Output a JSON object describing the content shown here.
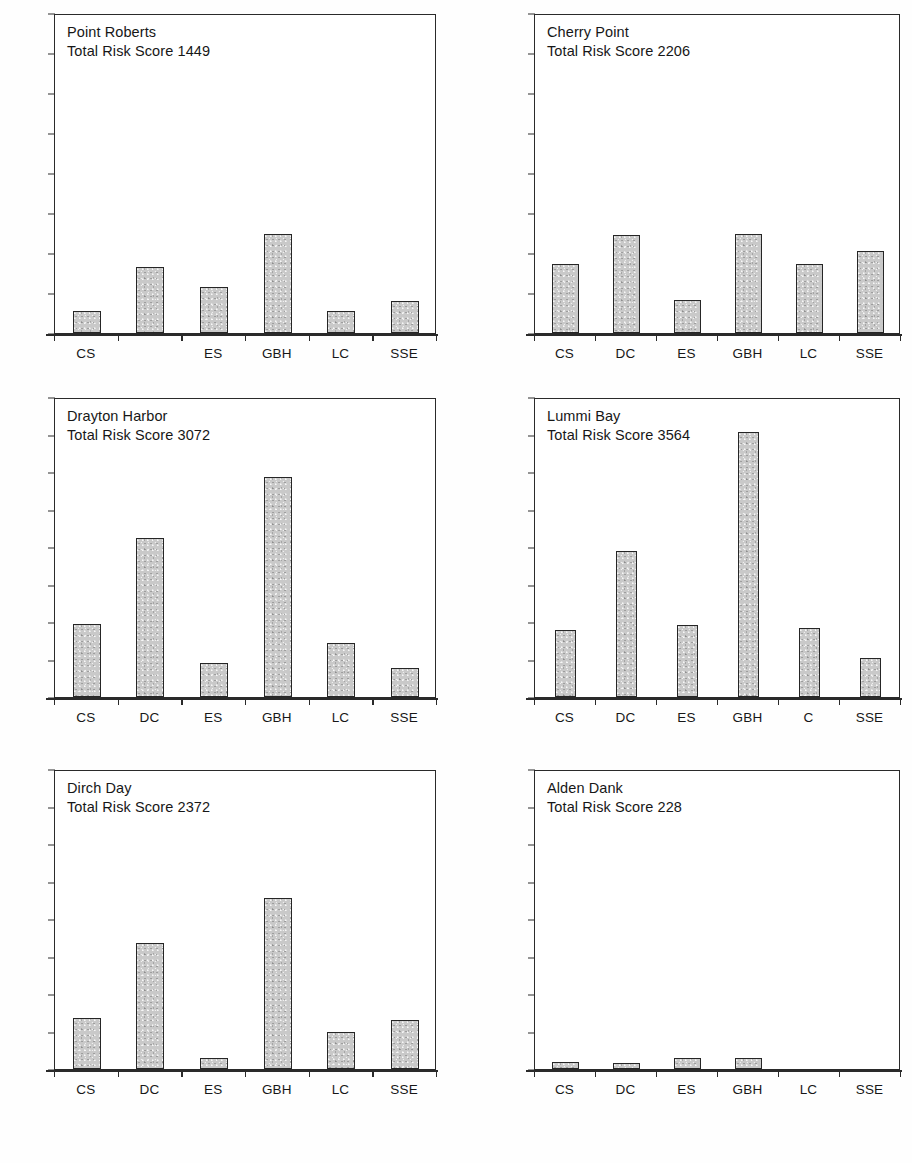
{
  "figure": {
    "axis_max": 1600,
    "axis_min": 0,
    "tick_step": 200,
    "bar_fill_color": "#c9c9c9",
    "bar_border_color": "#262626",
    "frame_color": "#2a2a2a"
  },
  "chart_data": [
    {
      "type": "bar",
      "title": "Point Roberts",
      "subtitle": "Total Risk Score 1449",
      "total_risk_score": 1449,
      "categories": [
        "CS",
        "",
        "ES",
        "GBH",
        "LC",
        "SSE"
      ],
      "values": [
        110,
        330,
        230,
        495,
        110,
        160
      ],
      "xlabel": "",
      "ylabel": "",
      "ylim": [
        0,
        1600
      ],
      "yticks": [
        "0",
        "200",
        "400",
        "600",
        "800",
        "1000",
        "1200",
        "1400",
        "1600"
      ],
      "show_ytick_labels": true,
      "grid": false
    },
    {
      "type": "bar",
      "title": "Cherry Point",
      "subtitle": "Total Risk Score 2206",
      "total_risk_score": 2206,
      "categories": [
        "CS",
        "DC",
        "ES",
        "GBH",
        "LC",
        "SSE"
      ],
      "values": [
        345,
        490,
        165,
        495,
        345,
        410
      ],
      "xlabel": "",
      "ylabel": "",
      "ylim": [
        0,
        1600
      ],
      "yticks": [],
      "show_ytick_labels": false,
      "grid": false
    },
    {
      "type": "bar",
      "title": "Drayton Harbor",
      "subtitle": "Total Risk Score 3072",
      "total_risk_score": 3072,
      "categories": [
        "CS",
        "DC",
        "ES",
        "GBH",
        "LC",
        "SSE"
      ],
      "values": [
        390,
        850,
        180,
        1175,
        290,
        155
      ],
      "xlabel": "",
      "ylabel": "",
      "ylim": [
        0,
        1600
      ],
      "yticks": [
        "0",
        "200",
        "400",
        "600",
        "800",
        "1000",
        "1200",
        "1400",
        "1600"
      ],
      "show_ytick_labels": true,
      "grid": false
    },
    {
      "type": "bar",
      "title": "Lummi Bay",
      "subtitle": "Total Risk Score 3564",
      "total_risk_score": 3564,
      "categories": [
        "CS",
        "DC",
        "ES",
        "GBH",
        "C",
        "SSE"
      ],
      "values": [
        355,
        780,
        385,
        1415,
        370,
        210
      ],
      "xlabel": "",
      "ylabel": "",
      "ylim": [
        0,
        1600
      ],
      "yticks": [],
      "show_ytick_labels": false,
      "grid": false
    },
    {
      "type": "bar",
      "title": "Dirch Day",
      "subtitle": "Total Risk Score 2372",
      "total_risk_score": 2372,
      "categories": [
        "CS",
        "DC",
        "ES",
        "GBH",
        "LC",
        "SSE"
      ],
      "values": [
        270,
        670,
        60,
        910,
        200,
        260
      ],
      "xlabel": "",
      "ylabel": "",
      "ylim": [
        0,
        1600
      ],
      "yticks": [
        "0",
        "200",
        "400",
        "600",
        "800",
        "1000",
        "1200",
        "14UU",
        "1600"
      ],
      "show_ytick_labels": true,
      "grid": false
    },
    {
      "type": "bar",
      "title": "Alden Dank",
      "subtitle": "Total Risk Score 228",
      "total_risk_score": 228,
      "categories": [
        "CS",
        "DC",
        "ES",
        "GBH",
        "LC",
        "SSE"
      ],
      "values": [
        40,
        30,
        60,
        60,
        0,
        0
      ],
      "xlabel": "",
      "ylabel": "",
      "ylim": [
        0,
        1600
      ],
      "yticks": [],
      "show_ytick_labels": false,
      "grid": false
    }
  ]
}
